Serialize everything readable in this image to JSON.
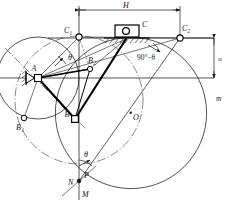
{
  "figure": {
    "type": "kinematic-mechanism-diagram",
    "background_color": "#ffffff",
    "line_color": "#1a1a1a",
    "thick_link_color": "#000000"
  },
  "dimensions": {
    "horizontal": {
      "label": "H",
      "from_point": "C1",
      "to_point": "C2",
      "position": "top"
    },
    "vertical": {
      "label": "u",
      "position": "right"
    }
  },
  "points": [
    {
      "id": "A",
      "label": "A",
      "sub": "",
      "x": 38,
      "y": 78,
      "kind": "fixed-pivot"
    },
    {
      "id": "B",
      "label": "B",
      "sub": "",
      "x": 75,
      "y": 119,
      "kind": "joint"
    },
    {
      "id": "B1",
      "label": "B",
      "sub": "1",
      "x": 24,
      "y": 118,
      "kind": "joint"
    },
    {
      "id": "B2",
      "label": "B",
      "sub": "2",
      "x": 90,
      "y": 69,
      "kind": "joint"
    },
    {
      "id": "C1",
      "label": "C",
      "sub": "1",
      "x": 79,
      "y": 37,
      "kind": "joint"
    },
    {
      "id": "C2",
      "label": "C",
      "sub": "2",
      "x": 180,
      "y": 38,
      "kind": "joint"
    },
    {
      "id": "C",
      "label": "C",
      "sub": "",
      "x": 126,
      "y": 39,
      "kind": "slider"
    },
    {
      "id": "O",
      "label": "O",
      "sub": "",
      "x": 131,
      "y": 113,
      "kind": "center"
    },
    {
      "id": "N",
      "label": "N",
      "sub": "",
      "x": 79,
      "y": 181,
      "kind": "mark"
    },
    {
      "id": "P",
      "label": "P",
      "sub": "",
      "x": 79,
      "y": 181,
      "kind": "mark"
    },
    {
      "id": "M",
      "label": "M",
      "sub": "",
      "x": 79,
      "y": 193,
      "kind": "mark"
    }
  ],
  "labels": {
    "theta_top": "θ",
    "theta_bottom": "θ",
    "angle_complement": "90°−θ",
    "circle_m": "m",
    "dim_H": "H",
    "dim_u": "u",
    "point_A": "A",
    "point_B": "B",
    "point_B1_base": "B",
    "point_B1_sub": "1",
    "point_B2_base": "B",
    "point_B2_sub": "2",
    "point_C": "C",
    "point_C1_base": "C",
    "point_C1_sub": "1",
    "point_C2_base": "C",
    "point_C2_sub": "2",
    "point_O": "O",
    "point_N": "N",
    "point_P": "P",
    "point_M": "M"
  },
  "colors": {
    "stroke": "#1a1a1a",
    "thick": "#000000",
    "thin": "#4a4a4a",
    "hatch": "#2a2a2a"
  }
}
